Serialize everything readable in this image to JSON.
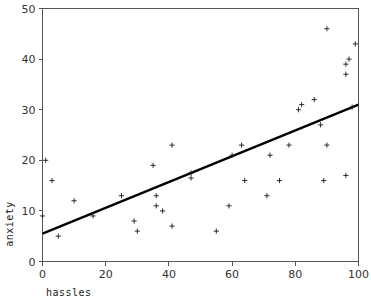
{
  "chart_data": {
    "type": "scatter",
    "title": "",
    "subtitle": "",
    "xlabel": "hassles",
    "ylabel": "anxiety",
    "xlim": [
      0,
      100
    ],
    "ylim": [
      0,
      50
    ],
    "xticks": [
      0,
      20,
      40,
      60,
      80,
      100
    ],
    "yticks": [
      0,
      10,
      20,
      30,
      40,
      50
    ],
    "xtick_labels": [
      "0",
      "20",
      "40",
      "60",
      "80",
      "100"
    ],
    "ytick_labels": [
      "0",
      "10",
      "20",
      "30",
      "40",
      "50"
    ],
    "grid": false,
    "legend": null,
    "legend_position": "none",
    "marker_style": "plus",
    "annotations": [],
    "series": [
      {
        "name": "observations",
        "marker": "plus",
        "points": [
          [
            0,
            9
          ],
          [
            1,
            20
          ],
          [
            3,
            16
          ],
          [
            5,
            5
          ],
          [
            10,
            12
          ],
          [
            16,
            9
          ],
          [
            25,
            13
          ],
          [
            29,
            8
          ],
          [
            30,
            6
          ],
          [
            35,
            19
          ],
          [
            36,
            13
          ],
          [
            36,
            11
          ],
          [
            38,
            10
          ],
          [
            41,
            23
          ],
          [
            41,
            7
          ],
          [
            47,
            16.5
          ],
          [
            47,
            17.5
          ],
          [
            55,
            6
          ],
          [
            59,
            11
          ],
          [
            60,
            21
          ],
          [
            63,
            23
          ],
          [
            64,
            16
          ],
          [
            71,
            13
          ],
          [
            72,
            21
          ],
          [
            75,
            16
          ],
          [
            78,
            23
          ],
          [
            81,
            30
          ],
          [
            82,
            31
          ],
          [
            86,
            32
          ],
          [
            88,
            27
          ],
          [
            89,
            16
          ],
          [
            90,
            46
          ],
          [
            90,
            23
          ],
          [
            96,
            17
          ],
          [
            96,
            37
          ],
          [
            96,
            39
          ],
          [
            97,
            40
          ],
          [
            98,
            30.5
          ],
          [
            99,
            43
          ]
        ]
      }
    ],
    "fit_line": {
      "name": "least-squares regression line",
      "x_start": 0,
      "y_start": 5.5,
      "x_end": 100,
      "y_end": 31,
      "slope": 0.255,
      "intercept": 5.5
    }
  }
}
